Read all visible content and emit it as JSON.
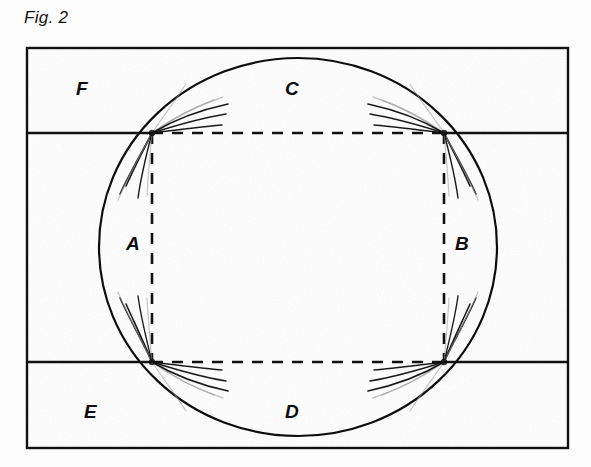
{
  "figure": {
    "caption": "Fig. 2",
    "background_color": "#fdfdfd",
    "ink_color": "#111111",
    "ghost_ink_color": "#9a9a9a"
  },
  "frame": {
    "name": "rectangular-border",
    "x": 27,
    "y": 48,
    "width": 541,
    "height": 400,
    "stroke_width": 2.4
  },
  "circle": {
    "name": "main-circle",
    "cx": 298,
    "cy": 247,
    "rx": 199,
    "ry": 189,
    "stroke_width": 2.2
  },
  "horizontal_lines": [
    {
      "name": "upper-solid-left",
      "x1": 28,
      "y1": 133,
      "x2": 152,
      "y2": 133
    },
    {
      "name": "upper-solid-right",
      "x1": 444,
      "y1": 133,
      "x2": 567,
      "y2": 133
    },
    {
      "name": "lower-solid-left",
      "x1": 28,
      "y1": 362,
      "x2": 152,
      "y2": 362
    },
    {
      "name": "lower-solid-right",
      "x1": 444,
      "y1": 362,
      "x2": 567,
      "y2": 362
    }
  ],
  "dashed_lines": [
    {
      "name": "dashed-top",
      "x1": 152,
      "y1": 133,
      "x2": 444,
      "y2": 133
    },
    {
      "name": "dashed-bottom",
      "x1": 152,
      "y1": 362,
      "x2": 444,
      "y2": 362
    },
    {
      "name": "dashed-left",
      "x1": 152,
      "y1": 133,
      "x2": 152,
      "y2": 362
    },
    {
      "name": "dashed-right",
      "x1": 444,
      "y1": 133,
      "x2": 444,
      "y2": 362
    }
  ],
  "intersections": [
    {
      "name": "node-top-left",
      "x": 152,
      "y": 133
    },
    {
      "name": "node-top-right",
      "x": 444,
      "y": 133
    },
    {
      "name": "node-bottom-left",
      "x": 152,
      "y": 362
    },
    {
      "name": "node-bottom-right",
      "x": 444,
      "y": 362
    }
  ],
  "labels": [
    {
      "name": "region-label-f",
      "text": "F",
      "x": 76,
      "y": 95
    },
    {
      "name": "region-label-c",
      "text": "C",
      "x": 285,
      "y": 95
    },
    {
      "name": "region-label-a",
      "text": "A",
      "x": 126,
      "y": 250
    },
    {
      "name": "region-label-b",
      "text": "B",
      "x": 455,
      "y": 250
    },
    {
      "name": "region-label-e",
      "text": "E",
      "x": 84,
      "y": 418
    },
    {
      "name": "region-label-d",
      "text": "D",
      "x": 285,
      "y": 418
    }
  ],
  "fracture_fans": [
    {
      "name": "fan-top-left",
      "origin_x": 152,
      "origin_y": 133,
      "strokes": [
        {
          "d": "M152,133 C168,122 190,109 214,100",
          "w": 1.5,
          "ghost": true
        },
        {
          "d": "M152,133 C170,120 196,106 223,97",
          "w": 1.4,
          "ghost": true
        },
        {
          "d": "M152,133 C172,121 200,110 228,104",
          "w": 1.6,
          "ghost": false
        },
        {
          "d": "M152,133 C174,126 202,118 226,114",
          "w": 1.5,
          "ghost": false
        },
        {
          "d": "M152,133 C176,130 200,127 222,125",
          "w": 1.3,
          "ghost": false
        },
        {
          "d": "M152,133 C162,118 176,100 186,84",
          "w": 1.2,
          "ghost": true
        },
        {
          "d": "M152,133 C145,147 135,166 126,186",
          "w": 1.6,
          "ghost": false
        },
        {
          "d": "M152,133 C143,150 130,172 120,194",
          "w": 1.5,
          "ghost": false
        },
        {
          "d": "M152,133 C142,152 128,176 118,200",
          "w": 1.3,
          "ghost": true
        },
        {
          "d": "M152,133 C147,152 141,176 138,198",
          "w": 1.4,
          "ghost": false
        },
        {
          "d": "M152,133 C150,154 148,176 147,196",
          "w": 1.2,
          "ghost": true
        }
      ]
    },
    {
      "name": "fan-top-right",
      "origin_x": 444,
      "origin_y": 133,
      "strokes": [
        {
          "d": "M444,133 C428,122 406,109 382,100",
          "w": 1.5,
          "ghost": true
        },
        {
          "d": "M444,133 C426,120 400,106 373,97",
          "w": 1.4,
          "ghost": true
        },
        {
          "d": "M444,133 C424,121 396,110 368,104",
          "w": 1.6,
          "ghost": false
        },
        {
          "d": "M444,133 C422,126 394,118 370,114",
          "w": 1.5,
          "ghost": false
        },
        {
          "d": "M444,133 C420,130 396,127 374,125",
          "w": 1.3,
          "ghost": false
        },
        {
          "d": "M444,133 C434,118 420,100 410,84",
          "w": 1.2,
          "ghost": true
        },
        {
          "d": "M444,133 C451,147 461,166 470,186",
          "w": 1.6,
          "ghost": false
        },
        {
          "d": "M444,133 C453,150 466,172 476,194",
          "w": 1.5,
          "ghost": false
        },
        {
          "d": "M444,133 C454,152 468,176 478,200",
          "w": 1.3,
          "ghost": true
        },
        {
          "d": "M444,133 C449,152 455,176 458,198",
          "w": 1.4,
          "ghost": false
        },
        {
          "d": "M444,133 C446,154 448,176 449,196",
          "w": 1.2,
          "ghost": true
        }
      ]
    },
    {
      "name": "fan-bottom-left",
      "origin_x": 152,
      "origin_y": 362,
      "strokes": [
        {
          "d": "M152,362 C145,345 135,324 126,304",
          "w": 1.6,
          "ghost": false
        },
        {
          "d": "M152,362 C143,343 130,320 120,298",
          "w": 1.5,
          "ghost": false
        },
        {
          "d": "M152,362 C142,341 128,316 118,292",
          "w": 1.3,
          "ghost": true
        },
        {
          "d": "M152,362 C147,342 141,318 138,296",
          "w": 1.4,
          "ghost": false
        },
        {
          "d": "M152,362 C150,340 148,318 147,298",
          "w": 1.2,
          "ghost": true
        },
        {
          "d": "M152,362 C168,373 190,386 214,395",
          "w": 1.5,
          "ghost": true
        },
        {
          "d": "M152,362 C170,375 196,389 223,398",
          "w": 1.4,
          "ghost": true
        },
        {
          "d": "M152,362 C172,374 200,385 228,391",
          "w": 1.6,
          "ghost": false
        },
        {
          "d": "M152,362 C174,369 202,377 226,381",
          "w": 1.5,
          "ghost": false
        },
        {
          "d": "M152,362 C176,365 200,368 222,370",
          "w": 1.3,
          "ghost": false
        },
        {
          "d": "M152,362 C162,377 176,395 186,411",
          "w": 1.2,
          "ghost": true
        }
      ]
    },
    {
      "name": "fan-bottom-right",
      "origin_x": 444,
      "origin_y": 362,
      "strokes": [
        {
          "d": "M444,362 C451,345 461,324 470,304",
          "w": 1.6,
          "ghost": false
        },
        {
          "d": "M444,362 C453,343 466,320 476,298",
          "w": 1.5,
          "ghost": false
        },
        {
          "d": "M444,362 C454,341 468,316 478,292",
          "w": 1.3,
          "ghost": true
        },
        {
          "d": "M444,362 C449,342 455,318 458,296",
          "w": 1.4,
          "ghost": false
        },
        {
          "d": "M444,362 C446,340 448,318 449,298",
          "w": 1.2,
          "ghost": true
        },
        {
          "d": "M444,362 C428,373 406,386 382,395",
          "w": 1.5,
          "ghost": true
        },
        {
          "d": "M444,362 C426,375 400,389 373,398",
          "w": 1.4,
          "ghost": true
        },
        {
          "d": "M444,362 C424,374 396,385 368,391",
          "w": 1.6,
          "ghost": false
        },
        {
          "d": "M444,362 C422,369 394,377 370,381",
          "w": 1.5,
          "ghost": false
        },
        {
          "d": "M444,362 C420,365 396,368 374,370",
          "w": 1.3,
          "ghost": false
        },
        {
          "d": "M444,362 C434,377 420,395 410,411",
          "w": 1.2,
          "ghost": true
        }
      ]
    }
  ]
}
